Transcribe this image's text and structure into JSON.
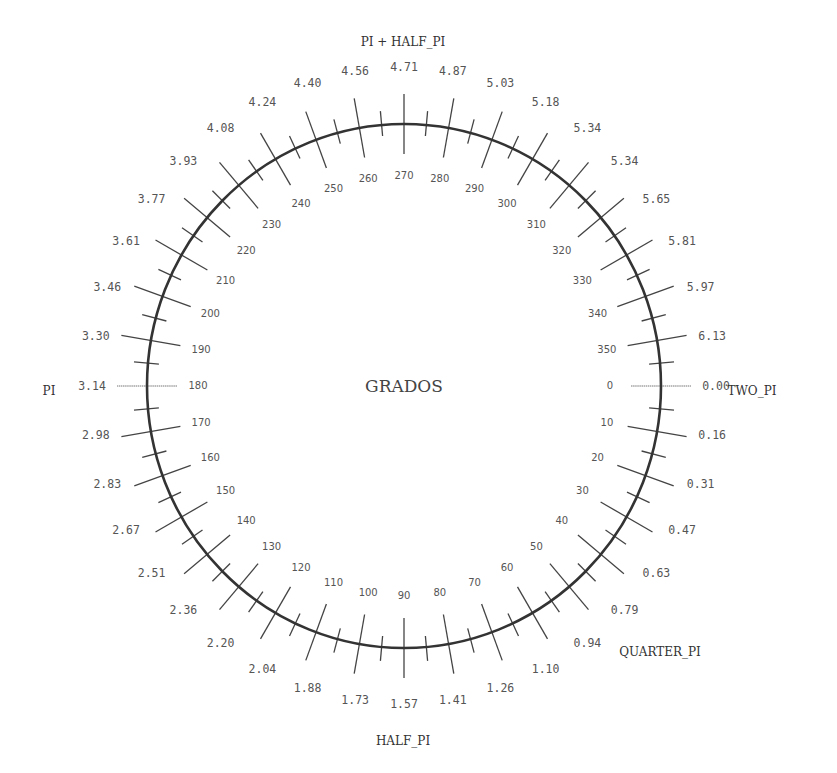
{
  "diagram": {
    "title": "GRADOS",
    "center": {
      "x": 404,
      "y": 386
    },
    "radius": {
      "x": 257,
      "y": 262
    },
    "colors": {
      "circle": "#333333",
      "tick": "#444444",
      "zero_tick": "#777777",
      "text": "#555555",
      "background": "#ffffff"
    },
    "tick_spec": {
      "major_every_deg": 10,
      "minor_every_deg": 5,
      "major_inner": 30,
      "major_outer": 30,
      "minor_inner": 11,
      "minor_outer": 14
    },
    "degree_label_radius": 206,
    "radian_label_radius": 312,
    "degree_labels": [
      "0",
      "10",
      "20",
      "30",
      "40",
      "50",
      "60",
      "70",
      "80",
      "90",
      "100",
      "110",
      "120",
      "130",
      "140",
      "150",
      "160",
      "170",
      "180",
      "190",
      "200",
      "210",
      "220",
      "230",
      "240",
      "250",
      "260",
      "270",
      "280",
      "290",
      "300",
      "310",
      "320",
      "330",
      "340",
      "350"
    ],
    "radian_labels": [
      "0.00",
      "0.16",
      "0.31",
      "0.47",
      "0.63",
      "0.79",
      "0.94",
      "1.10",
      "1.26",
      "1.41",
      "1.57",
      "1.73",
      "1.88",
      "2.04",
      "2.20",
      "2.36",
      "2.51",
      "2.67",
      "2.83",
      "2.98",
      "3.14",
      "3.30",
      "3.46",
      "3.61",
      "3.77",
      "3.93",
      "4.08",
      "4.24",
      "4.40",
      "4.56",
      "4.71",
      "4.87",
      "5.03",
      "5.18",
      "5.34",
      "5.34",
      "5.65",
      "5.81",
      "5.97",
      "6.13"
    ],
    "named_labels": [
      {
        "text": "TWO_PI",
        "x": 752,
        "y": 391
      },
      {
        "text": "QUARTER_PI",
        "x": 660,
        "y": 652
      },
      {
        "text": "HALF_PI",
        "x": 403,
        "y": 741
      },
      {
        "text": "PI",
        "x": 49,
        "y": 391
      },
      {
        "text": "PI + HALF_PI",
        "x": 403,
        "y": 42
      }
    ]
  },
  "chart_data": {
    "type": "polar-scale",
    "title": "GRADOS",
    "degrees": [
      0,
      10,
      20,
      30,
      40,
      50,
      60,
      70,
      80,
      90,
      100,
      110,
      120,
      130,
      140,
      150,
      160,
      170,
      180,
      190,
      200,
      210,
      220,
      230,
      240,
      250,
      260,
      270,
      280,
      290,
      300,
      310,
      320,
      330,
      340,
      350
    ],
    "radians_shown": [
      "0.00",
      "0.16",
      "0.31",
      "0.47",
      "0.63",
      "0.79",
      "0.94",
      "1.10",
      "1.26",
      "1.41",
      "1.57",
      "1.73",
      "1.88",
      "2.04",
      "2.20",
      "2.36",
      "2.51",
      "2.67",
      "2.83",
      "2.98",
      "3.14",
      "3.30",
      "3.46",
      "3.61",
      "3.77",
      "3.93",
      "4.08",
      "4.24",
      "4.40",
      "4.56",
      "4.71",
      "4.87",
      "5.03",
      "5.18",
      "5.34",
      "5.34",
      "5.65",
      "5.81",
      "5.97",
      "6.13"
    ],
    "annotations": [
      "TWO_PI",
      "QUARTER_PI",
      "HALF_PI",
      "PI",
      "PI + HALF_PI"
    ]
  }
}
